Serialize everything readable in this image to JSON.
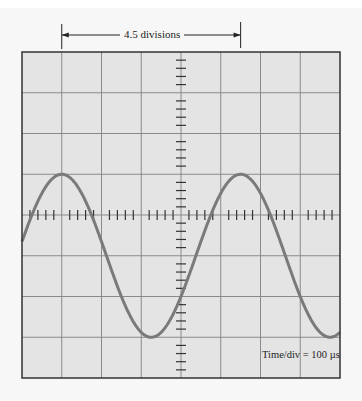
{
  "measurement": {
    "label": "4.5 divisions",
    "start_div": 1,
    "end_div": 5.5
  },
  "scope": {
    "time_per_div_label": "Time/div = 100  µs",
    "horizontal_divisions": 8,
    "vertical_divisions": 8,
    "minor_ticks_per_div": 5
  },
  "waveform": {
    "type": "sine",
    "period_divisions": 4.5,
    "amplitude_divisions": 2,
    "dc_offset_divisions": -1,
    "first_peak_div": 1,
    "color": "#7a7a7a"
  },
  "colors": {
    "screen_bg": "#e4e4e4",
    "grid": "#8a8a8a",
    "frame": "#333333",
    "trace": "#7a7a7a"
  }
}
